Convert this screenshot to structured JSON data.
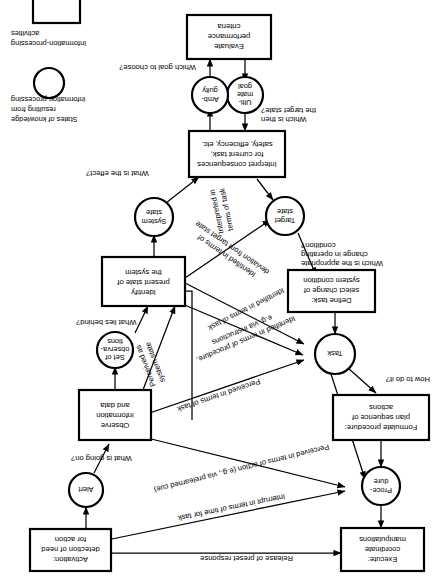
{
  "figure": {
    "name": "decision-ladder",
    "orientation_note": "rotated-180",
    "background": "#ffffff",
    "ink": "#000000"
  },
  "nodes": {
    "activation": {
      "id": "activation",
      "shape": "box",
      "lines": [
        "Activation:",
        "detection of need",
        "for action"
      ]
    },
    "alert": {
      "id": "alert",
      "shape": "circle",
      "lines": [
        "Alert"
      ]
    },
    "observe": {
      "id": "observe",
      "shape": "box",
      "lines": [
        "Observe",
        "information",
        "and data"
      ]
    },
    "set_of_observations": {
      "id": "set-of-observations",
      "shape": "circle",
      "lines": [
        "Set of",
        "observa-",
        "tions"
      ]
    },
    "identify": {
      "id": "identify",
      "shape": "box",
      "lines": [
        "Identify",
        "present state of",
        "the system"
      ]
    },
    "system_state": {
      "id": "system-state",
      "shape": "circle",
      "lines": [
        "System",
        "state"
      ]
    },
    "interpret": {
      "id": "interpret",
      "shape": "box",
      "lines": [
        "Interpret consequences",
        "for current task,",
        "safety, efficiency, etc."
      ]
    },
    "ambiguity": {
      "id": "ambiguity",
      "shape": "circle",
      "lines": [
        "Amb-",
        "guity"
      ]
    },
    "ultimate_goal": {
      "id": "ultimate-goal",
      "shape": "circle",
      "lines": [
        "Ulti-",
        "mate",
        "goal"
      ]
    },
    "evaluate": {
      "id": "evaluate",
      "shape": "box",
      "lines": [
        "Evaluate",
        "performance",
        "criteria"
      ]
    },
    "target_state": {
      "id": "target-state",
      "shape": "circle",
      "lines": [
        "Target",
        "state"
      ]
    },
    "define_task": {
      "id": "define-task",
      "shape": "box",
      "lines": [
        "Define task:",
        "select change of",
        "system condition"
      ]
    },
    "task": {
      "id": "task",
      "shape": "circle",
      "lines": [
        "Task"
      ]
    },
    "formulate": {
      "id": "formulate",
      "shape": "box",
      "lines": [
        "Formulate procedure:",
        "plan sequence of",
        "actions"
      ]
    },
    "procedure": {
      "id": "procedure",
      "shape": "circle",
      "lines": [
        "Proce-",
        "dure"
      ]
    },
    "execute": {
      "id": "execute",
      "shape": "box",
      "lines": [
        "Execute:",
        "coordinate",
        "manipulations"
      ]
    }
  },
  "edge_labels": {
    "release_preset": "Release of preset response",
    "what_going_on": "What is going on?",
    "what_lies_behind": "What lies behind?",
    "what_effect": "What is the effect?",
    "which_goal": "Which goal to choose?",
    "which_target_state_1": "Which is then",
    "which_target_state_2": "the target state?",
    "which_change_1": "Which is the appropriate",
    "which_change_2": "change in operating",
    "which_change_3": "condition?",
    "how_to_do_it": "How to do it?",
    "interrupt_time": "Interrupt in terms of time for task",
    "perceived_action": "Perceived in terms of action (e.g., via prelearned cue)",
    "perceived_task": "Perceived in terms of task",
    "perceived_system_state_1": "Perceived as",
    "perceived_system_state_2": "system state",
    "identified_procedure_1": "Identified in terms of procedure,",
    "identified_procedure_2": "e.g. via instructions",
    "identified_task": "Identified in terms of task",
    "identified_deviation_1": "Identified in terms of",
    "identified_deviation_2": "deviation from target state",
    "interpreted_task_1": "Interpreted in",
    "interpreted_task_2": "terms of task"
  },
  "legend": {
    "states_of_knowledge": [
      "States of knowledge",
      "resulting from",
      "information processing"
    ],
    "information_processing": [
      "Information-processing",
      "activities"
    ]
  }
}
